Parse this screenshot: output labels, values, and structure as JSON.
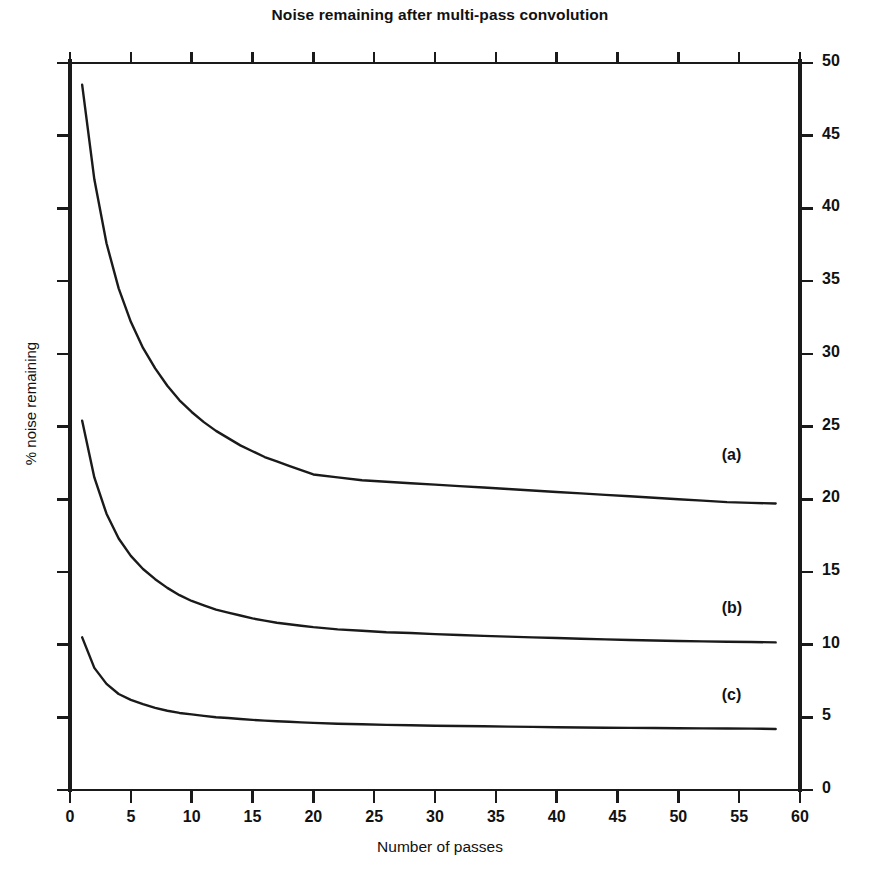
{
  "chart_data": {
    "type": "line",
    "title": "Noise remaining after multi-pass convolution",
    "xlabel": "Number of passes",
    "ylabel": "% noise remaining",
    "xlim": [
      0,
      60
    ],
    "ylim": [
      0,
      50
    ],
    "grid": false,
    "legend_position": "inline-right",
    "x_ticks": [
      0,
      5,
      10,
      15,
      20,
      25,
      30,
      35,
      40,
      45,
      50,
      55,
      60
    ],
    "y_ticks": [
      0,
      5,
      10,
      15,
      20,
      25,
      30,
      35,
      40,
      45,
      50
    ],
    "y_axis_side": "right",
    "x": [
      1,
      2,
      3,
      4,
      5,
      6,
      7,
      8,
      9,
      10,
      11,
      12,
      13,
      14,
      15,
      16,
      17,
      18,
      19,
      20,
      22,
      24,
      26,
      28,
      30,
      32,
      34,
      36,
      38,
      40,
      42,
      44,
      46,
      48,
      50,
      52,
      54,
      56,
      58
    ],
    "series": [
      {
        "name": "(a)",
        "label": "(a)",
        "color": "#1a1a1a",
        "label_x": 58.5,
        "label_y": 22.9,
        "values": [
          48.5,
          42.0,
          37.6,
          34.5,
          32.2,
          30.4,
          29.0,
          27.8,
          26.8,
          26.0,
          25.3,
          24.7,
          24.2,
          23.7,
          23.3,
          22.9,
          22.6,
          22.3,
          22.0,
          21.7,
          21.5,
          21.3,
          21.2,
          21.1,
          21.0,
          20.9,
          20.8,
          20.7,
          20.6,
          20.5,
          20.4,
          20.3,
          20.2,
          20.1,
          20.0,
          19.9,
          19.8,
          19.75,
          19.7
        ]
      },
      {
        "name": "(b)",
        "label": "(b)",
        "color": "#1a1a1a",
        "label_x": 58.5,
        "label_y": 12.4,
        "values": [
          25.4,
          21.5,
          19.0,
          17.3,
          16.1,
          15.2,
          14.5,
          13.9,
          13.4,
          13.0,
          12.7,
          12.4,
          12.2,
          12.0,
          11.8,
          11.65,
          11.5,
          11.4,
          11.3,
          11.2,
          11.05,
          10.95,
          10.85,
          10.8,
          10.72,
          10.66,
          10.6,
          10.55,
          10.5,
          10.45,
          10.4,
          10.36,
          10.32,
          10.28,
          10.25,
          10.22,
          10.2,
          10.18,
          10.15
        ]
      },
      {
        "name": "(c)",
        "label": "(c)",
        "color": "#1a1a1a",
        "label_x": 58.5,
        "label_y": 6.4,
        "values": [
          10.5,
          8.4,
          7.3,
          6.6,
          6.2,
          5.9,
          5.65,
          5.45,
          5.3,
          5.2,
          5.1,
          5.0,
          4.95,
          4.88,
          4.82,
          4.77,
          4.73,
          4.69,
          4.65,
          4.62,
          4.56,
          4.52,
          4.48,
          4.45,
          4.42,
          4.4,
          4.38,
          4.36,
          4.34,
          4.32,
          4.3,
          4.28,
          4.27,
          4.26,
          4.25,
          4.24,
          4.23,
          4.22,
          4.2
        ]
      }
    ]
  },
  "figure": {
    "background_color": "#ffffff",
    "axis_color": "#1a1a1a",
    "line_color": "#1a1a1a"
  }
}
